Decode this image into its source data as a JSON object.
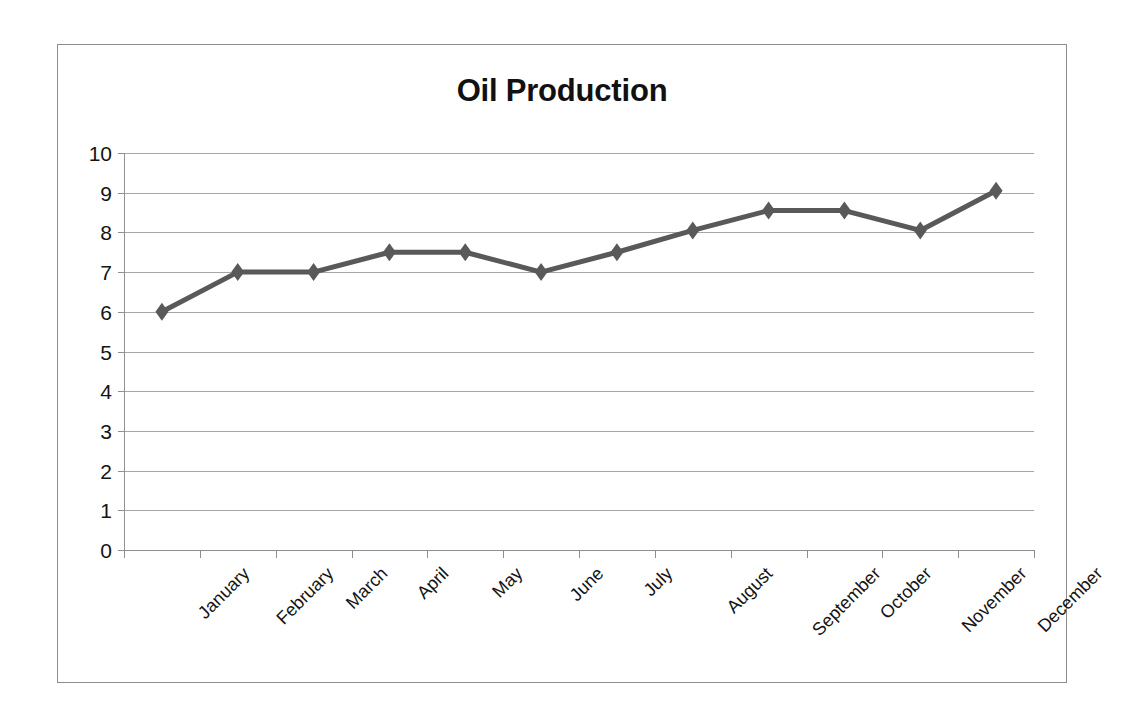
{
  "chart_data": {
    "type": "line",
    "title": "Oil Production",
    "xlabel": "",
    "ylabel": "",
    "categories": [
      "January",
      "February",
      "March",
      "April",
      "May",
      "June",
      "July",
      "August",
      "September",
      "October",
      "November",
      "December"
    ],
    "values": [
      6.0,
      7.0,
      7.0,
      7.5,
      7.5,
      7.0,
      7.5,
      8.05,
      8.55,
      8.55,
      8.05,
      9.05
    ],
    "series": [
      {
        "name": "Oil Production",
        "values": [
          6.0,
          7.0,
          7.0,
          7.5,
          7.5,
          7.0,
          7.5,
          8.05,
          8.55,
          8.55,
          8.05,
          9.05
        ]
      }
    ],
    "ylim": [
      0,
      10
    ],
    "ytick_labels": [
      "10",
      "9",
      "8",
      "7",
      "6",
      "5",
      "4",
      "3",
      "2",
      "1",
      "0"
    ],
    "ytick_values": [
      10,
      9,
      8,
      7,
      6,
      5,
      4,
      3,
      2,
      1,
      0
    ],
    "grid": true,
    "legend": false,
    "legend_position": "none",
    "marker": "diamond",
    "series_color": "#595959",
    "gridline_color": "#a6a6a6",
    "axis_color": "#8f8f8f",
    "frame_color": "#8d8d8d",
    "background_color": "#ffffff",
    "title_color": "#111111",
    "tick_label_color": "#141414",
    "xtick_label_rotation": -45
  }
}
